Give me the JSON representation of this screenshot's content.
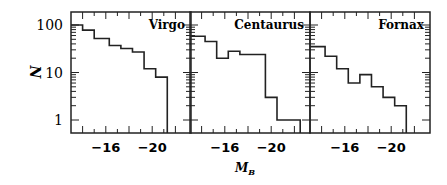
{
  "chart_data": {
    "type": "bar",
    "subtype": "step-histogram",
    "layout": "3 panels side by side, shared log y-axis",
    "xlabel": "M_B",
    "ylabel": "N",
    "yscale": "log",
    "ylim": [
      0.5,
      190
    ],
    "yticks": [
      1,
      10,
      100
    ],
    "ytick_labels": [
      "1",
      "10",
      "100"
    ],
    "xlim": [
      -13,
      -23
    ],
    "xticks": [
      -16,
      -20
    ],
    "xtick_labels": [
      "−16",
      "−20"
    ],
    "grid": false,
    "legend": null,
    "panels": [
      {
        "title": "Virgo",
        "bin_edges": [
          -13,
          -14,
          -15,
          -16.3,
          -17.3,
          -18.3,
          -19.3,
          -20.3,
          -21.3
        ],
        "values": [
          100,
          78,
          52,
          37,
          32,
          27,
          12,
          8
        ]
      },
      {
        "title": "Centaurus",
        "bin_edges": [
          -13,
          -14.3,
          -15.3,
          -16.3,
          -17.3,
          -19.5,
          -20.5,
          -22.5
        ],
        "values": [
          58,
          45,
          20,
          28,
          24,
          3,
          1
        ]
      },
      {
        "title": "Fornax",
        "bin_edges": [
          -13,
          -14.3,
          -15.3,
          -16.3,
          -17.3,
          -18.3,
          -19.3,
          -20.3,
          -21.3
        ],
        "values": [
          35,
          22,
          12,
          6,
          9,
          5,
          3,
          2
        ]
      }
    ]
  },
  "labels": {
    "y_axis_title": "N",
    "x_axis_title_main": "M",
    "x_axis_title_sub": "B",
    "ytick_100": "100",
    "ytick_10": "10",
    "ytick_1": "1",
    "panel_titles": [
      "Virgo",
      "Centaurus",
      "Fornax"
    ],
    "xtick_m16": "−16",
    "xtick_m20": "−20"
  },
  "style": {
    "line_color": "#222222",
    "background": "#ffffff"
  }
}
